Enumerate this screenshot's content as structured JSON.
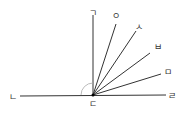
{
  "diagram": {
    "type": "angle-rays",
    "vertex": {
      "label": "ㄷ",
      "x": 93,
      "y": 95
    },
    "baseline": {
      "left": {
        "label": "ㄴ",
        "x": 20,
        "y": 96
      },
      "right": {
        "label": "ㄹ",
        "x": 166,
        "y": 95
      }
    },
    "rays": [
      {
        "label": "ㄱ",
        "x": 93,
        "y": 15
      },
      {
        "label": "ㅇ",
        "x": 116,
        "y": 24
      },
      {
        "label": "ㅅ",
        "x": 136,
        "y": 33
      },
      {
        "label": "ㅂ",
        "x": 150,
        "y": 54
      },
      {
        "label": "ㅁ",
        "x": 161,
        "y": 75
      }
    ],
    "line_color": "#333333",
    "arc_color": "#aaaaaa"
  }
}
